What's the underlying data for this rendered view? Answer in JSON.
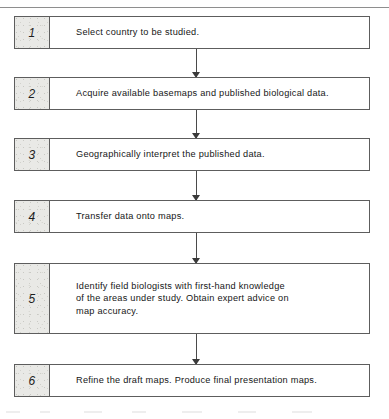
{
  "diagram": {
    "kind": "flowchart",
    "orientation": "vertical",
    "title": "",
    "accent_color": "#e9e9e6",
    "border_color": "#5d5d5d",
    "text_color": "#161616",
    "steps": [
      {
        "number": "1",
        "text": "Select country to be studied."
      },
      {
        "number": "2",
        "text": "Acquire available basemaps and published biological data."
      },
      {
        "number": "3",
        "text": "Geographically interpret the published data."
      },
      {
        "number": "4",
        "text": "Transfer data onto maps."
      },
      {
        "number": "5",
        "text": "Identify field biologists with first-hand knowledge\nof the areas under study. Obtain expert advice on\nmap accuracy."
      },
      {
        "number": "6",
        "text": "Refine the draft maps. Produce final presentation maps."
      }
    ],
    "connectors": [
      {
        "from": "1",
        "to": "2",
        "arrow": "down"
      },
      {
        "from": "2",
        "to": "3",
        "arrow": "down"
      },
      {
        "from": "3",
        "to": "4",
        "arrow": "down"
      },
      {
        "from": "4",
        "to": "5",
        "arrow": "down"
      },
      {
        "from": "5",
        "to": "6",
        "arrow": "down"
      }
    ]
  }
}
